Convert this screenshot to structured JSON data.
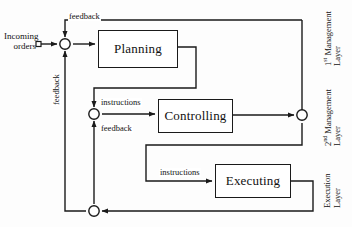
{
  "diagram": {
    "colors": {
      "stroke": "#1a1a1a",
      "background": "#ffffff",
      "text": "#111111"
    },
    "nodes": [
      {
        "id": "planning",
        "label": "Planning",
        "x": 98,
        "y": 30,
        "w": 80,
        "h": 38
      },
      {
        "id": "controlling",
        "label": "Controlling",
        "x": 158,
        "y": 99,
        "w": 75,
        "h": 34
      },
      {
        "id": "executing",
        "label": "Executing",
        "x": 215,
        "y": 164,
        "w": 76,
        "h": 34
      }
    ],
    "source": {
      "line1": "Incoming",
      "line2": "orders"
    },
    "edge_labels": [
      {
        "id": "feedback-top",
        "text": "feedback",
        "x": 68,
        "y": 12
      },
      {
        "id": "feedback-left",
        "text": "feedback",
        "x": 52,
        "y": 106,
        "rotated": true
      },
      {
        "id": "instructions-middle",
        "text": "instructions",
        "x": 100,
        "y": 98
      },
      {
        "id": "feedback-middle",
        "text": "feedback",
        "x": 100,
        "y": 125
      },
      {
        "id": "instructions-bottom",
        "text": "instructions",
        "x": 160,
        "y": 168
      }
    ],
    "layer_labels": [
      {
        "id": "layer-1",
        "line1": "1",
        "sup": "st",
        "rest": " Management",
        "line2": "Layer",
        "x": 325,
        "y": 62
      },
      {
        "id": "layer-2",
        "line1": "2",
        "sup": "nd",
        "rest": " Management",
        "line2": "Layer",
        "x": 325,
        "y": 138
      },
      {
        "id": "layer-3",
        "line1": "Execution",
        "sup": "",
        "rest": "",
        "line2": "Layer",
        "x": 325,
        "y": 205
      }
    ],
    "junctions": [
      {
        "id": "junction-top",
        "cx": 65,
        "cy": 44
      },
      {
        "id": "junction-middle",
        "cx": 94,
        "cy": 114
      },
      {
        "id": "junction-right",
        "cx": 302,
        "cy": 115
      },
      {
        "id": "junction-bottom",
        "cx": 94,
        "cy": 211
      }
    ]
  }
}
